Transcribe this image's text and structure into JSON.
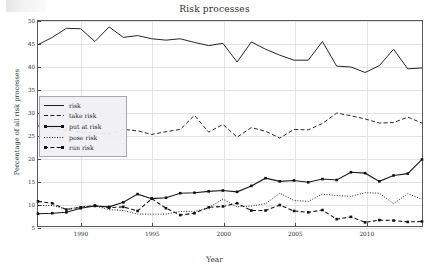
{
  "figure": {
    "title": "Risk processes",
    "xlabel": "Year",
    "ylabel": "Percentage of all risk processes"
  },
  "legend": {
    "items": [
      {
        "label": "risk",
        "style": "solid",
        "marker": "none"
      },
      {
        "label": "take risk",
        "style": "dashed",
        "marker": "none"
      },
      {
        "label": "put at risk",
        "style": "solid",
        "marker": "square"
      },
      {
        "label": "pose risk",
        "style": "dotted",
        "marker": "none"
      },
      {
        "label": "run risk",
        "style": "dashed",
        "marker": "square"
      }
    ]
  },
  "axes": {
    "y_ticks": [
      50,
      45,
      40,
      35,
      30,
      25,
      20,
      15,
      10,
      5
    ],
    "x_ticks": [
      1990,
      1995,
      2000,
      2005,
      2010
    ],
    "ylim": [
      5,
      50
    ],
    "xlim": [
      1987,
      2014
    ]
  },
  "chart_data": {
    "type": "line",
    "title": "Risk processes",
    "xlabel": "Year",
    "ylabel": "Percentage of all risk processes",
    "xlim": [
      1987,
      2014
    ],
    "ylim": [
      5,
      50
    ],
    "grid": true,
    "legend_position": "center-left",
    "x": [
      1987,
      1988,
      1989,
      1990,
      1991,
      1992,
      1993,
      1994,
      1995,
      1996,
      1997,
      1998,
      1999,
      2000,
      2001,
      2002,
      2003,
      2004,
      2005,
      2006,
      2007,
      2008,
      2009,
      2010,
      2011,
      2012,
      2013,
      2014
    ],
    "series": [
      {
        "name": "risk",
        "style": "solid",
        "marker": "none",
        "values": [
          44.8,
          46.4,
          48.4,
          48.3,
          45.5,
          48.7,
          46.4,
          46.8,
          46.1,
          45.8,
          46.1,
          45.3,
          44.6,
          45.1,
          41.0,
          45.4,
          43.8,
          42.5,
          41.4,
          41.4,
          45.5,
          40.1,
          39.9,
          38.7,
          40.2,
          43.8,
          39.5,
          39.7
        ]
      },
      {
        "name": "take risk",
        "style": "dashed",
        "marker": "none",
        "values": [
          27.0,
          26.4,
          26.0,
          25.6,
          25.4,
          25.2,
          26.2,
          25.9,
          25.1,
          25.7,
          26.2,
          29.3,
          25.6,
          27.3,
          24.5,
          26.6,
          25.8,
          24.3,
          26.2,
          26.1,
          27.5,
          29.8,
          29.2,
          28.5,
          27.6,
          27.7,
          28.9,
          27.6
        ]
      },
      {
        "name": "put at risk",
        "style": "solid",
        "marker": "square",
        "values": [
          7.7,
          7.8,
          8.0,
          8.9,
          9.4,
          9.2,
          10.2,
          12.0,
          11.0,
          11.2,
          12.2,
          12.3,
          12.6,
          12.8,
          12.5,
          13.8,
          15.5,
          14.8,
          15.0,
          14.6,
          15.3,
          15.1,
          16.8,
          16.6,
          14.8,
          16.1,
          16.5,
          19.6
        ]
      },
      {
        "name": "pose risk",
        "style": "dotted",
        "marker": "none",
        "values": [
          9.5,
          9.5,
          8.7,
          9.2,
          9.4,
          8.6,
          8.4,
          7.6,
          7.6,
          7.6,
          8.2,
          8.2,
          9.0,
          10.9,
          9.2,
          9.4,
          9.9,
          12.2,
          10.6,
          10.4,
          12.0,
          11.7,
          11.5,
          12.3,
          12.2,
          9.9,
          12.1,
          10.9
        ]
      },
      {
        "name": "run risk",
        "style": "dashed",
        "marker": "square",
        "values": [
          10.4,
          10.0,
          8.6,
          9.1,
          9.5,
          9.0,
          9.2,
          8.3,
          11.0,
          8.9,
          7.4,
          7.8,
          9.1,
          9.3,
          10.0,
          8.4,
          8.4,
          9.6,
          8.3,
          8.0,
          8.5,
          6.5,
          7.0,
          5.8,
          6.3,
          6.2,
          5.9,
          6.0
        ]
      }
    ]
  }
}
